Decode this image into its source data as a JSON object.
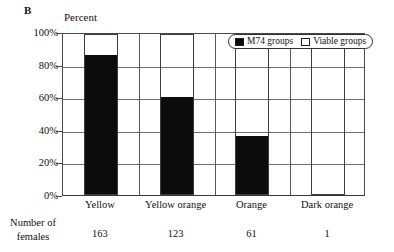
{
  "panel": {
    "label": "B"
  },
  "axis": {
    "y_title": "Percent",
    "y_ticks": [
      "100%",
      "80%",
      "60%",
      "40%",
      "20%",
      "0%"
    ]
  },
  "legend": {
    "items": [
      {
        "label": "M74 groups",
        "swatch": "filled-square-icon",
        "color": "#0c0c0c"
      },
      {
        "label": "Viable groups",
        "swatch": "empty-square-icon",
        "color": "#ffffff"
      }
    ]
  },
  "footer": {
    "title_line1": "Number of",
    "title_line2": "females",
    "values": [
      "163",
      "123",
      "61",
      "1"
    ]
  },
  "chart_data": {
    "type": "bar",
    "title": "",
    "subtitle": "",
    "xlabel": "",
    "ylabel": "Percent",
    "ylim": [
      0,
      100
    ],
    "grid": true,
    "stacked": true,
    "legend_position": "top-right",
    "categories": [
      "Yellow",
      "Yellow orange",
      "Orange",
      "Dark orange"
    ],
    "series": [
      {
        "name": "M74 groups",
        "color": "#0c0c0c",
        "values": [
          86,
          60,
          36,
          0
        ]
      },
      {
        "name": "Viable groups",
        "color": "#ffffff",
        "values": [
          14,
          40,
          64,
          100
        ]
      }
    ],
    "annotations": {
      "number_of_females": [
        163,
        123,
        61,
        1
      ]
    }
  }
}
